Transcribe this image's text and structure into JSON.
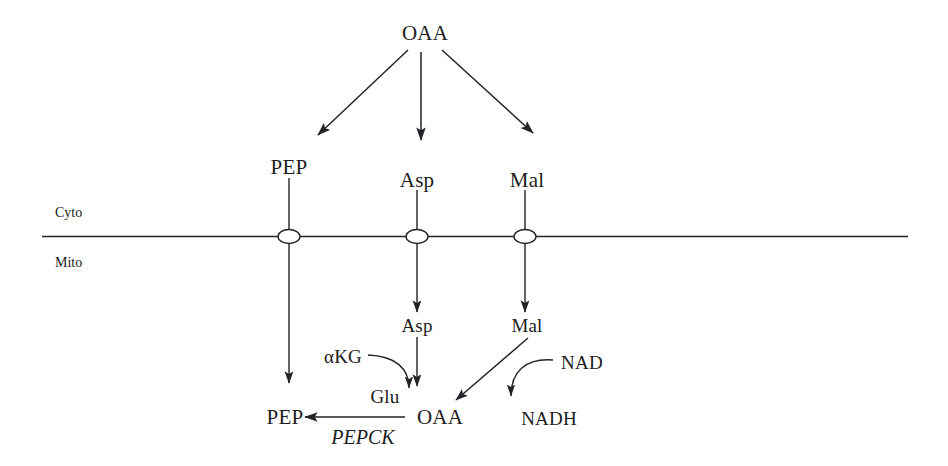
{
  "diagram": {
    "type": "pathway-diagram",
    "stroke_color": "#232328",
    "background_color": "#ffffff",
    "compartments": {
      "upper_label": "Cyto",
      "lower_label": "Mito"
    },
    "nodes": {
      "oaa_top": "OAA",
      "pep_cyto": "PEP",
      "asp_cyto": "Asp",
      "mal_cyto": "Mal",
      "asp_mito": "Asp",
      "mal_mito": "Mal",
      "akg": "αKG",
      "glu": "Glu",
      "oaa_mito": "OAA",
      "pep_mito": "PEP",
      "nad": "NAD",
      "nadh": "NADH"
    },
    "enzymes": {
      "pepck": "PEPCK"
    },
    "transporters": [
      {
        "name": "pep-transporter",
        "x": 289
      },
      {
        "name": "asp-transporter",
        "x": 417
      },
      {
        "name": "mal-transporter",
        "x": 525
      }
    ],
    "membrane": {
      "y": 236,
      "x_start": 42,
      "x_end": 908
    }
  }
}
